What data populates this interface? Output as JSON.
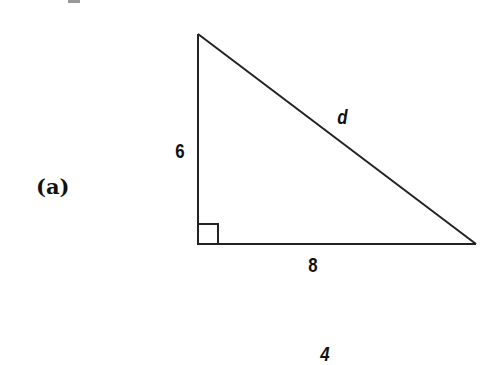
{
  "figure": {
    "part_label": "(a)",
    "shape": "right-triangle",
    "triangle": {
      "vertices": {
        "top": [
          198,
          34
        ],
        "right_angle": [
          198,
          244
        ],
        "right": [
          476,
          244
        ]
      },
      "right_angle_marker_size": 20,
      "stroke_color": "#222222",
      "stroke_width": 2
    },
    "labels": {
      "vertical_leg": "6",
      "horizontal_leg": "8",
      "hypotenuse": "d"
    },
    "next_figure_partial_label": "4"
  }
}
